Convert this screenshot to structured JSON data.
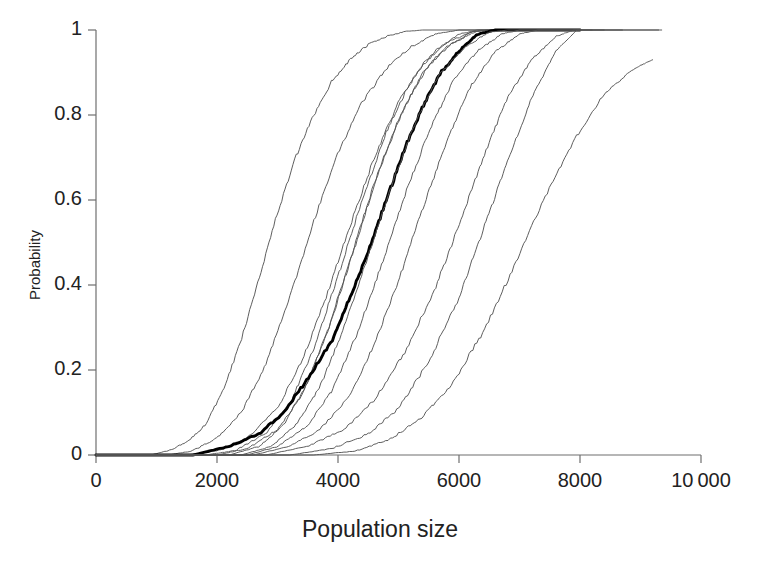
{
  "chart_data": {
    "type": "line",
    "title": "",
    "subtitle": "",
    "xlabel": "Population size",
    "ylabel": "Probability",
    "xlim": [
      0,
      10000
    ],
    "ylim": [
      0,
      1
    ],
    "grid": false,
    "legend": null,
    "xticks": [
      0,
      2000,
      4000,
      6000,
      8000,
      10000
    ],
    "xtick_labels": [
      "0",
      "2000",
      "4000",
      "6000",
      "8000",
      "10 000"
    ],
    "yticks": [
      0,
      0.2,
      0.4,
      0.6,
      0.8,
      1
    ],
    "ytick_labels": [
      "0",
      "0.2",
      "0.4",
      "0.6",
      "0.8",
      "1"
    ],
    "annotations": [],
    "series": [
      {
        "name": "curve-1",
        "style": "thin",
        "color": "#555555",
        "x": [
          900,
          1200,
          1500,
          1800,
          2100,
          2400,
          2700,
          3000,
          3300,
          3600,
          3900,
          4200,
          4500,
          4800,
          5100,
          5400
        ],
        "y": [
          0.0,
          0.01,
          0.03,
          0.07,
          0.15,
          0.27,
          0.42,
          0.57,
          0.7,
          0.8,
          0.88,
          0.93,
          0.965,
          0.985,
          0.996,
          1.0
        ]
      },
      {
        "name": "curve-2",
        "style": "thin",
        "color": "#555555",
        "x": [
          1200,
          1600,
          2000,
          2400,
          2800,
          3200,
          3600,
          4000,
          4400,
          4800,
          5200,
          5600,
          6000
        ],
        "y": [
          0.0,
          0.01,
          0.04,
          0.1,
          0.21,
          0.37,
          0.55,
          0.71,
          0.83,
          0.91,
          0.96,
          0.99,
          1.0
        ]
      },
      {
        "name": "curve-3",
        "style": "thin",
        "color": "#555555",
        "x": [
          1500,
          2000,
          2500,
          3000,
          3400,
          3800,
          4200,
          4600,
          5000,
          5400,
          5800,
          6200,
          6500
        ],
        "y": [
          0.0,
          0.01,
          0.04,
          0.11,
          0.22,
          0.37,
          0.54,
          0.7,
          0.83,
          0.92,
          0.97,
          0.995,
          1.0
        ]
      },
      {
        "name": "curve-4",
        "style": "thin",
        "color": "#555555",
        "x": [
          1800,
          2300,
          2800,
          3200,
          3600,
          4000,
          4400,
          4800,
          5200,
          5600,
          6000,
          6300
        ],
        "y": [
          0.0,
          0.01,
          0.05,
          0.12,
          0.25,
          0.42,
          0.6,
          0.76,
          0.88,
          0.95,
          0.99,
          1.0
        ]
      },
      {
        "name": "curve-5",
        "style": "thin",
        "color": "#555555",
        "x": [
          2000,
          2500,
          3000,
          3400,
          3800,
          4200,
          4600,
          5000,
          5400,
          5800,
          6200,
          6500
        ],
        "y": [
          0.0,
          0.015,
          0.06,
          0.14,
          0.28,
          0.46,
          0.64,
          0.79,
          0.9,
          0.96,
          0.995,
          1.0
        ]
      },
      {
        "name": "curve-6",
        "style": "thin",
        "color": "#555555",
        "x": [
          2200,
          2700,
          3100,
          3500,
          3900,
          4300,
          4700,
          5100,
          5500,
          5900,
          6300,
          6600
        ],
        "y": [
          0.0,
          0.02,
          0.07,
          0.17,
          0.32,
          0.5,
          0.68,
          0.82,
          0.92,
          0.97,
          0.998,
          1.0
        ]
      },
      {
        "name": "curve-7-bold-overall",
        "style": "bold",
        "color": "#000000",
        "x": [
          1600,
          2200,
          2700,
          3100,
          3500,
          3900,
          4200,
          4500,
          4800,
          5100,
          5400,
          5700,
          6000,
          6300,
          6600
        ],
        "y": [
          0.0,
          0.02,
          0.05,
          0.1,
          0.18,
          0.27,
          0.37,
          0.48,
          0.6,
          0.72,
          0.82,
          0.9,
          0.95,
          0.99,
          1.0
        ]
      },
      {
        "name": "curve-8",
        "style": "thin",
        "color": "#555555",
        "x": [
          2400,
          2900,
          3300,
          3700,
          4100,
          4500,
          4900,
          5300,
          5700,
          6100,
          6500,
          6800
        ],
        "y": [
          0.0,
          0.02,
          0.07,
          0.16,
          0.3,
          0.47,
          0.64,
          0.79,
          0.9,
          0.96,
          0.995,
          1.0
        ]
      },
      {
        "name": "curve-9",
        "style": "thin",
        "color": "#555555",
        "x": [
          2500,
          3000,
          3500,
          3900,
          4300,
          4700,
          5100,
          5500,
          5900,
          6300,
          6700,
          7000
        ],
        "y": [
          0.0,
          0.02,
          0.07,
          0.15,
          0.28,
          0.44,
          0.61,
          0.76,
          0.88,
          0.95,
          0.99,
          1.0
        ]
      },
      {
        "name": "curve-10",
        "style": "thin",
        "color": "#555555",
        "x": [
          2600,
          3200,
          3700,
          4200,
          4600,
          5000,
          5400,
          5800,
          6200,
          6600,
          7000,
          7300
        ],
        "y": [
          0.0,
          0.02,
          0.06,
          0.14,
          0.26,
          0.41,
          0.58,
          0.74,
          0.87,
          0.95,
          0.99,
          1.0
        ]
      },
      {
        "name": "curve-11",
        "style": "thin",
        "color": "#555555",
        "x": [
          2800,
          3500,
          4100,
          4600,
          5100,
          5600,
          6000,
          6400,
          6800,
          7200,
          7600,
          7900
        ],
        "y": [
          0.0,
          0.02,
          0.06,
          0.13,
          0.24,
          0.39,
          0.54,
          0.7,
          0.84,
          0.93,
          0.985,
          1.0
        ]
      },
      {
        "name": "curve-12",
        "style": "thin",
        "color": "#555555",
        "x": [
          3200,
          3900,
          4500,
          5000,
          5500,
          6000,
          6400,
          6800,
          7200,
          7600,
          7950
        ],
        "y": [
          0.0,
          0.015,
          0.05,
          0.11,
          0.22,
          0.37,
          0.53,
          0.69,
          0.84,
          0.95,
          1.0
        ]
      },
      {
        "name": "curve-13",
        "style": "thin",
        "color": "#555555",
        "x": [
          3600,
          4300,
          4900,
          5400,
          5900,
          6400,
          6900,
          7400,
          7900,
          8400,
          8900,
          9200
        ],
        "y": [
          0.0,
          0.01,
          0.04,
          0.09,
          0.17,
          0.29,
          0.44,
          0.6,
          0.74,
          0.85,
          0.91,
          0.93
        ]
      }
    ]
  },
  "axes": {
    "plot_left_px": 96,
    "plot_right_px": 701,
    "plot_top_px": 30,
    "plot_bottom_px": 455
  }
}
